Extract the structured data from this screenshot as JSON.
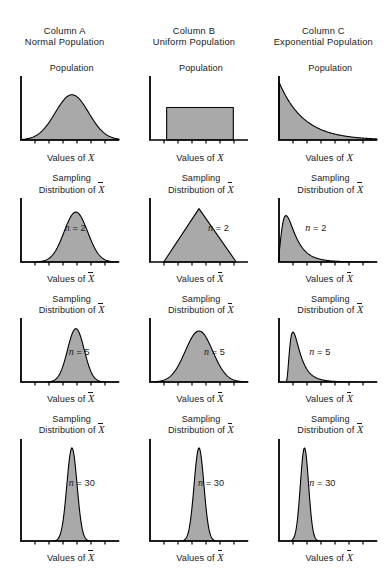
{
  "figure": {
    "columns": [
      {
        "id": "A",
        "line1": "Column A",
        "line2": "Normal Population"
      },
      {
        "id": "B",
        "line1": "Column B",
        "line2": "Uniform Population"
      },
      {
        "id": "C",
        "line1": "Column C",
        "line2": "Exponential Population"
      }
    ],
    "labels": {
      "population_title": "Population",
      "sampling_line1": "Sampling",
      "sampling_line2_prefix": "Distribution of ",
      "axis_prefix": "Values of ",
      "x_symbol": "X",
      "xbar_symbol": "X",
      "n_prefix": "n",
      "n_equals": " = "
    },
    "colors": {
      "fill": "#a9a9a9",
      "stroke": "#000000",
      "axis": "#000000",
      "text": "#1a1a1a",
      "background": "#ffffff"
    }
  },
  "chart_data": {
    "type": "line",
    "layout": {
      "rows": 4,
      "cols": 3,
      "grid": false,
      "legend": "none"
    },
    "xlabel_population": "Values of X",
    "xlabel_sampling": "Values of X̄",
    "ylabel": "",
    "row_labels": [
      "Population",
      "n = 2",
      "n = 5",
      "n = 30"
    ],
    "column_labels": [
      "Normal Population",
      "Uniform Population",
      "Exponential Population"
    ],
    "panels": [
      {
        "row": 0,
        "col": 0,
        "column_id": "A",
        "title": "Population",
        "axis_label": "Values of X",
        "n": null,
        "shape": "normal",
        "description": "Symmetric bell curve centered in the panel",
        "center": 0.52,
        "spread": 0.17,
        "peak_height": 0.78
      },
      {
        "row": 0,
        "col": 1,
        "column_id": "B",
        "title": "Population",
        "axis_label": "Values of X",
        "n": null,
        "shape": "uniform",
        "description": "Flat rectangle of constant density",
        "left": 0.17,
        "right": 0.85,
        "peak_height": 0.56
      },
      {
        "row": 0,
        "col": 2,
        "column_id": "C",
        "title": "Population",
        "axis_label": "Values of X",
        "n": null,
        "shape": "exponential",
        "description": "Monotone decreasing curve, maximum at the y axis",
        "rate": 4.0,
        "peak_height": 1.0
      },
      {
        "row": 1,
        "col": 0,
        "column_id": "A",
        "title": "Sampling Distribution of X̄",
        "axis_label": "Values of X̄",
        "n": 2,
        "shape": "normal",
        "description": "Bell curve, narrower than the population",
        "center": 0.56,
        "spread": 0.12,
        "peak_height": 0.86
      },
      {
        "row": 1,
        "col": 1,
        "column_id": "B",
        "title": "Sampling Distribution of X̄",
        "axis_label": "Values of X̄",
        "n": 2,
        "shape": "triangular",
        "description": "Triangle peaking at the centre of the uniform range",
        "left": 0.14,
        "mode": 0.5,
        "right": 0.88,
        "peak_height": 0.92
      },
      {
        "row": 1,
        "col": 2,
        "column_id": "C",
        "title": "Sampling Distribution of X̄",
        "axis_label": "Values of X̄",
        "n": 2,
        "shape": "right-skewed",
        "description": "Strongly right skewed with a long upper tail",
        "mode": 0.12,
        "spread": 0.17,
        "peak_height": 0.8
      },
      {
        "row": 2,
        "col": 0,
        "column_id": "A",
        "title": "Sampling Distribution of X̄",
        "axis_label": "Values of X̄",
        "n": 5,
        "shape": "normal",
        "description": "Bell curve, narrower still",
        "center": 0.56,
        "spread": 0.085,
        "peak_height": 0.92
      },
      {
        "row": 2,
        "col": 1,
        "column_id": "B",
        "title": "Sampling Distribution of X̄",
        "axis_label": "Values of X̄",
        "n": 5,
        "shape": "normal",
        "description": "Approximately normal bell curve",
        "center": 0.5,
        "spread": 0.14,
        "peak_height": 0.88
      },
      {
        "row": 2,
        "col": 2,
        "column_id": "C",
        "title": "Sampling Distribution of X̄",
        "axis_label": "Values of X̄",
        "n": 5,
        "shape": "right-skewed",
        "description": "Mildly right skewed, shifted toward the y axis",
        "mode": 0.18,
        "spread": 0.13,
        "peak_height": 0.86
      },
      {
        "row": 3,
        "col": 0,
        "column_id": "A",
        "title": "Sampling Distribution of X̄",
        "axis_label": "Values of X̄",
        "n": 30,
        "shape": "normal",
        "description": "Very tall narrow bell curve",
        "center": 0.52,
        "spread": 0.052,
        "peak_height": 0.97
      },
      {
        "row": 3,
        "col": 1,
        "column_id": "B",
        "title": "Sampling Distribution of X̄",
        "axis_label": "Values of X̄",
        "n": 30,
        "shape": "normal",
        "description": "Very tall narrow bell curve",
        "center": 0.5,
        "spread": 0.05,
        "peak_height": 0.97
      },
      {
        "row": 3,
        "col": 2,
        "column_id": "C",
        "title": "Sampling Distribution of X̄",
        "axis_label": "Values of X̄",
        "n": 30,
        "shape": "normal",
        "description": "Tall narrow, very slight right skew",
        "center": 0.26,
        "spread": 0.042,
        "peak_height": 0.97
      }
    ],
    "annotations": [
      {
        "text": "n = 2",
        "panels": [
          3,
          4,
          5
        ]
      },
      {
        "text": "n = 5",
        "panels": [
          6,
          7,
          8
        ]
      },
      {
        "text": "n = 30",
        "panels": [
          9,
          10,
          11
        ]
      }
    ]
  }
}
